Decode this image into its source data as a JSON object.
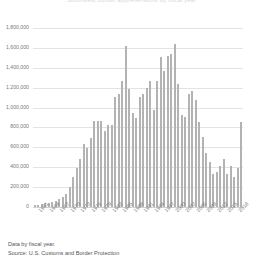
{
  "chart_data": {
    "type": "bar",
    "title": "Southwest border apprehensions by fiscal year",
    "xlabel": "",
    "ylabel": "",
    "ylim": [
      0,
      1800000
    ],
    "grid": true,
    "legend": "none",
    "ytick_labels": [
      "0",
      "200,000",
      "400,000",
      "600,000",
      "800,000",
      "1,000,000",
      "1,200,000",
      "1,400,000",
      "1,600,000",
      "1,800,000"
    ],
    "ytick_values": [
      0,
      200000,
      400000,
      600000,
      800000,
      1000000,
      1200000,
      1400000,
      1600000,
      1800000
    ],
    "xtick_labels": [
      "1961",
      "1964",
      "1967",
      "1970",
      "1973",
      "1976",
      "1979",
      "1982",
      "1985",
      "1988",
      "1991",
      "1994",
      "1997",
      "2000",
      "2003",
      "2006",
      "2009",
      "2012",
      "2015",
      "2018"
    ],
    "categories": [
      "1960",
      "1961",
      "1962",
      "1963",
      "1964",
      "1965",
      "1966",
      "1967",
      "1968",
      "1969",
      "1970",
      "1971",
      "1972",
      "1973",
      "1974",
      "1975",
      "1976",
      "1977",
      "1978",
      "1979",
      "1980",
      "1981",
      "1982",
      "1983",
      "1984",
      "1985",
      "1986",
      "1987",
      "1988",
      "1989",
      "1990",
      "1991",
      "1992",
      "1993",
      "1994",
      "1995",
      "1996",
      "1997",
      "1998",
      "1999",
      "2000",
      "2001",
      "2002",
      "2003",
      "2004",
      "2005",
      "2006",
      "2007",
      "2008",
      "2009",
      "2010",
      "2011",
      "2012",
      "2013",
      "2014",
      "2015",
      "2016",
      "2017",
      "2018",
      "2019"
    ],
    "values": [
      21022,
      24000,
      28000,
      36000,
      42000,
      52000,
      61000,
      79000,
      97000,
      128000,
      201780,
      302500,
      396495,
      480588,
      634777,
      596796,
      696039,
      864000,
      862000,
      860000,
      759420,
      825290,
      819919,
      1105670,
      1138566,
      1266999,
      1615844,
      1190488,
      943063,
      891147,
      1103353,
      1132933,
      1199560,
      1263490,
      979101,
      1271390,
      1507020,
      1368707,
      1516680,
      1537000,
      1643679,
      1235718,
      929809,
      905065,
      1139282,
      1171396,
      1071972,
      858638,
      705005,
      540865,
      447731,
      327577,
      356873,
      414397,
      479371,
      331333,
      408870,
      303916,
      396579,
      851508
    ]
  },
  "footer": {
    "line1": "Data by fiscal year.",
    "line2": "Source: U.S. Customs and Border Protection"
  }
}
